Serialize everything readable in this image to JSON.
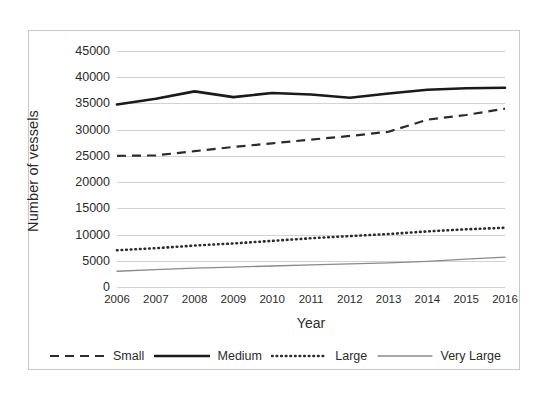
{
  "chart_data": {
    "type": "line",
    "title": "",
    "xlabel": "Year",
    "ylabel": "Number of vessels",
    "categories": [
      2006,
      2007,
      2008,
      2009,
      2010,
      2011,
      2012,
      2013,
      2014,
      2015,
      2016
    ],
    "ylim": [
      0,
      45000
    ],
    "ytick_values": [
      0,
      5000,
      10000,
      15000,
      20000,
      25000,
      30000,
      35000,
      40000,
      45000
    ],
    "ytick_labels": [
      "0",
      "5000",
      "10000",
      "15000",
      "20000",
      "25000",
      "30000",
      "35000",
      "40000",
      "45000"
    ],
    "xtick_labels": [
      "2006",
      "2007",
      "2008",
      "2009",
      "2010",
      "2011",
      "2012",
      "2013",
      "2014",
      "2015",
      "2016"
    ],
    "grid": true,
    "legend_position": "bottom",
    "series": [
      {
        "name": "Small",
        "style": "dashed",
        "color": "#2b2b2b",
        "values": [
          25000,
          25100,
          25900,
          26700,
          27400,
          28100,
          28800,
          29600,
          31900,
          32800,
          34000
        ]
      },
      {
        "name": "Medium",
        "style": "solid-thick",
        "color": "#1a1a1a",
        "values": [
          34800,
          35900,
          37300,
          36200,
          37000,
          36700,
          36100,
          36900,
          37600,
          37900,
          38000
        ]
      },
      {
        "name": "Large",
        "style": "dotted",
        "color": "#2b2b2b",
        "values": [
          7000,
          7400,
          7900,
          8300,
          8800,
          9300,
          9700,
          10100,
          10600,
          11000,
          11300
        ]
      },
      {
        "name": "Very Large",
        "style": "solid-thin",
        "color": "#8a8a8a",
        "values": [
          3000,
          3300,
          3600,
          3800,
          4000,
          4200,
          4400,
          4600,
          4900,
          5300,
          5700
        ]
      }
    ]
  },
  "legend": {
    "items": [
      {
        "label": "Small",
        "icon": "dashed-line-icon"
      },
      {
        "label": "Medium",
        "icon": "thick-solid-line-icon"
      },
      {
        "label": "Large",
        "icon": "dotted-line-icon"
      },
      {
        "label": "Very Large",
        "icon": "thin-solid-line-icon"
      }
    ]
  }
}
